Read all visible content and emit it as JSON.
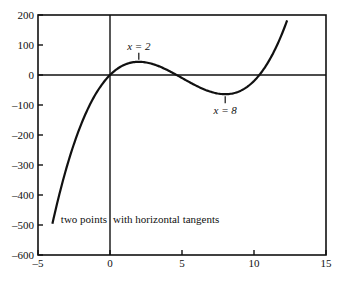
{
  "chart_data": {
    "type": "line",
    "title": "",
    "xlabel": "",
    "ylabel": "",
    "xlim": [
      -5,
      15
    ],
    "ylim": [
      -600,
      200
    ],
    "x_ticks": [
      -5,
      0,
      5,
      10,
      15
    ],
    "y_ticks": [
      200,
      100,
      0,
      -100,
      -200,
      -300,
      -400,
      -500,
      -600
    ],
    "x_tick_labels": [
      "-5",
      "0",
      "5",
      "10",
      "15"
    ],
    "y_tick_labels": [
      "200",
      "100",
      "0",
      "-100",
      "-200",
      "-300",
      "-400",
      "-500",
      "-600"
    ],
    "grid": false,
    "reference_lines": {
      "x": 0,
      "y": 0
    },
    "series": [
      {
        "name": "f(x) = x^3 - 15x^2 + 48x",
        "x": [
          -4,
          -3,
          -2,
          -1,
          0,
          1,
          2,
          3,
          4,
          5,
          6,
          7,
          8,
          9,
          10,
          11,
          12,
          12.3
        ],
        "y": [
          -496,
          -306,
          -164,
          -64,
          0,
          34,
          44,
          36,
          16,
          -10,
          -36,
          -56,
          -64,
          -54,
          -20,
          44,
          144,
          182
        ]
      }
    ],
    "annotations": [
      {
        "text": "x = 2",
        "x": 2,
        "y": 44
      },
      {
        "text": "x = 8",
        "x": 8,
        "y": -64
      },
      {
        "text": "two points with horizontal tangents",
        "x": -4,
        "y": -480
      }
    ]
  },
  "labels": {
    "max_label": "x = 2",
    "min_label": "x = 8",
    "caption_left": "two points",
    "caption_right": "with horizontal tangents"
  }
}
